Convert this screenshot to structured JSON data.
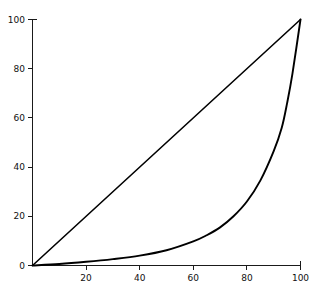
{
  "figure": {
    "background_color": "#ffffff",
    "line_color": "#000000",
    "axis_color": "#1a1a1a",
    "width": 316,
    "height": 292
  },
  "axes": {
    "x_ticks": [
      "20",
      "40",
      "60",
      "80",
      "100"
    ],
    "y_ticks": [
      "0",
      "20",
      "40",
      "60",
      "80",
      "100"
    ],
    "x_label": "",
    "y_label": "",
    "title": ""
  },
  "chart_data": {
    "type": "line",
    "title": "",
    "subtitle": "",
    "xlabel": "",
    "ylabel": "",
    "xlim": [
      0,
      100
    ],
    "ylim": [
      0,
      100
    ],
    "grid": false,
    "legend": false,
    "legend_position": "none",
    "xticks": [
      20,
      40,
      60,
      80,
      100
    ],
    "yticks": [
      0,
      20,
      40,
      60,
      80,
      100
    ],
    "annotations": [],
    "series": [
      {
        "name": "line-of-equality",
        "style": "straight",
        "x": [
          0,
          100
        ],
        "values": [
          0,
          100
        ]
      },
      {
        "name": "lorenz-curve",
        "style": "convex",
        "x": [
          0,
          10,
          20,
          30,
          40,
          50,
          60,
          65,
          70,
          75,
          80,
          85,
          90,
          93,
          95,
          97,
          100
        ],
        "values": [
          0,
          0.6,
          1.5,
          2.6,
          4.0,
          6.2,
          9.8,
          12.3,
          15.5,
          20.0,
          26.0,
          34.5,
          46.5,
          56.0,
          66.0,
          78.0,
          100
        ]
      }
    ]
  }
}
